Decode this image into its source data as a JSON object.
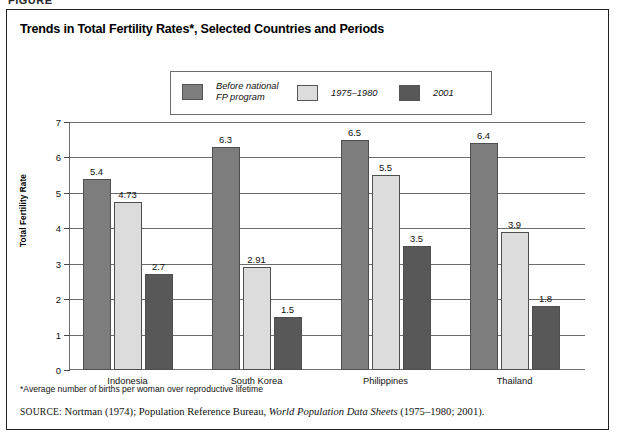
{
  "figure_kicker": "FIGURE",
  "chart_title": "Trends in Total Fertility Rates*, Selected Countries and Periods",
  "footnote": "*Average number of births per woman over reproductive lifetime",
  "source": {
    "label": "SOURCE:",
    "text_before_italic": "Nortman (1974); Population Reference Bureau,",
    "italic_title": "World Population Data Sheets",
    "text_after_italic": "(1975–2001).",
    "text_after_italic_actual": "(1975–1980; 2001)."
  },
  "colors": {
    "series_before": "#7d7d7d",
    "series_1975_1980": "#dcdcdc",
    "series_2001": "#585858",
    "axis": "#6f6f6f",
    "grid": "#6b6b6b",
    "text": "#111111",
    "frame": "#231f20"
  },
  "chart_data": {
    "type": "bar",
    "title": "Trends in Total Fertility Rates*, Selected Countries and Periods",
    "xlabel": "",
    "ylabel": "Total Fertility Rate",
    "ylim": [
      0,
      7
    ],
    "ytick_labels": [
      "0",
      "1",
      "2",
      "3",
      "4",
      "5",
      "6",
      "7"
    ],
    "yticks": [
      0,
      1,
      2,
      3,
      4,
      5,
      6,
      7
    ],
    "grid": true,
    "legend_position": "top-center",
    "categories": [
      "Indonesia",
      "South Korea",
      "Philippines",
      "Thailand"
    ],
    "series": [
      {
        "name": "Before national\nFP program",
        "legend_label": "Before national\nFP program",
        "color": "#7d7d7d",
        "values": [
          5.4,
          6.3,
          6.5,
          6.4
        ],
        "value_labels": [
          "5.4",
          "6.3",
          "6.5",
          "6.4"
        ]
      },
      {
        "name": "1975–1980",
        "legend_label": "1975–1980",
        "color": "#dcdcdc",
        "values": [
          4.73,
          2.91,
          5.5,
          3.9
        ],
        "value_labels": [
          "4.73",
          "2.91",
          "5.5",
          "3.9"
        ]
      },
      {
        "name": "2001",
        "legend_label": "2001",
        "color": "#585858",
        "values": [
          2.7,
          1.5,
          3.5,
          1.8
        ],
        "value_labels": [
          "2.7",
          "1.5",
          "3.5",
          "1.8"
        ]
      }
    ]
  }
}
